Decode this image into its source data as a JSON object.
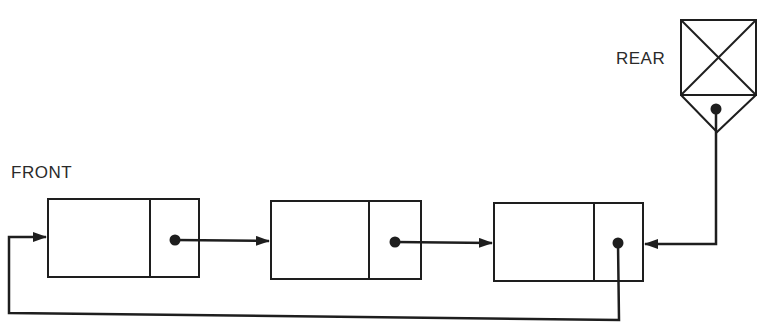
{
  "diagram": {
    "type": "linked-list-queue",
    "labels": {
      "front": "FRONT",
      "rear": "REAR"
    },
    "nodes": [
      {
        "id": "node-1",
        "data": "",
        "pointer": "node-2"
      },
      {
        "id": "node-2",
        "data": "",
        "pointer": "node-3"
      },
      {
        "id": "node-3",
        "data": "",
        "pointer": "node-1"
      }
    ],
    "rear_pointer_target": "node-3",
    "front_pointer_target": "node-1",
    "colors": {
      "line": "#1e1e1e",
      "background": "#ffffff"
    }
  }
}
